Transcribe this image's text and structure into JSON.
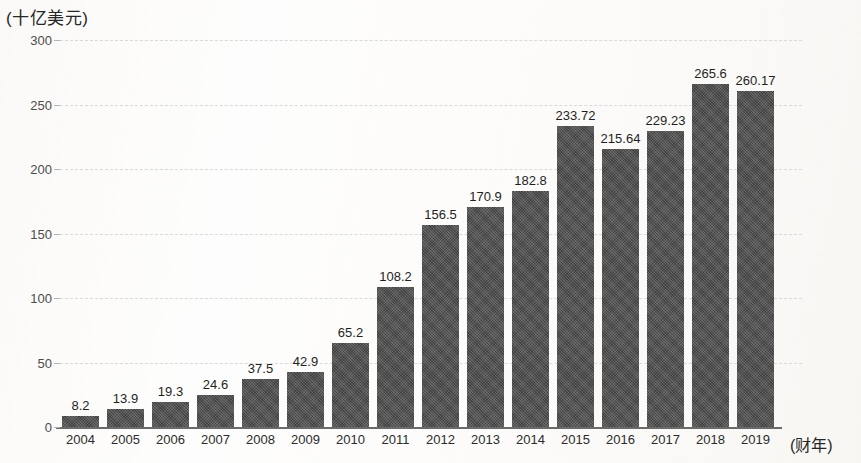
{
  "chart_data": {
    "type": "bar",
    "title": "",
    "subtitle": "",
    "xlabel": "(财年)",
    "ylabel": "(十亿美元)",
    "ylim": [
      0,
      300
    ],
    "yticks": [
      0,
      50,
      100,
      150,
      200,
      250,
      300
    ],
    "ytick_labels": [
      "0",
      "50",
      "100",
      "150",
      "200",
      "250",
      "300"
    ],
    "grid": true,
    "legend": "none",
    "bar_color": "#4d4d4d",
    "background_color": "#fcfbfa",
    "categories": [
      "2004",
      "2005",
      "2006",
      "2007",
      "2008",
      "2009",
      "2010",
      "2011",
      "2012",
      "2013",
      "2014",
      "2015",
      "2016",
      "2017",
      "2018",
      "2019"
    ],
    "values": [
      8.2,
      13.9,
      19.3,
      24.6,
      37.5,
      42.9,
      65.2,
      108.2,
      156.5,
      170.9,
      182.8,
      233.72,
      215.64,
      229.23,
      265.6,
      260.17
    ],
    "value_labels": [
      "8.2",
      "13.9",
      "19.3",
      "24.6",
      "37.5",
      "42.9",
      "65.2",
      "108.2",
      "156.5",
      "170.9",
      "182.8",
      "233.72",
      "215.64",
      "229.23",
      "265.6",
      "260.17"
    ],
    "annotations": []
  }
}
